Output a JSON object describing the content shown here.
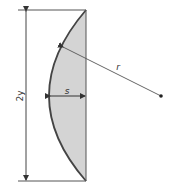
{
  "diagram": {
    "labels": {
      "chord_height": "2y",
      "sagitta": "s",
      "radius": "r"
    },
    "colors": {
      "fill": "#d4d4d4",
      "stroke": "#3a3a3a",
      "arc": "#444444"
    }
  }
}
